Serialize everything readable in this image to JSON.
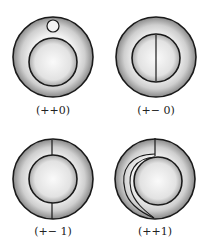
{
  "figure": {
    "panels": [
      {
        "id": "p1",
        "label": "(++0)",
        "feature": "small loop on outer annulus above inner disk"
      },
      {
        "id": "p2",
        "label": "(+− 0)",
        "feature": "vertical chord across inner disk"
      },
      {
        "id": "p3",
        "label": "(+− 1)",
        "feature": "two radial segments crossing annulus (top and bottom)"
      },
      {
        "id": "p4",
        "label": "(++1)",
        "feature": "radial segment at top and curved band wrapping left to bottom"
      }
    ],
    "colors": {
      "stroke": "#1a1a1a",
      "shade": "#9a9a9a",
      "background": "#ffffff"
    }
  }
}
